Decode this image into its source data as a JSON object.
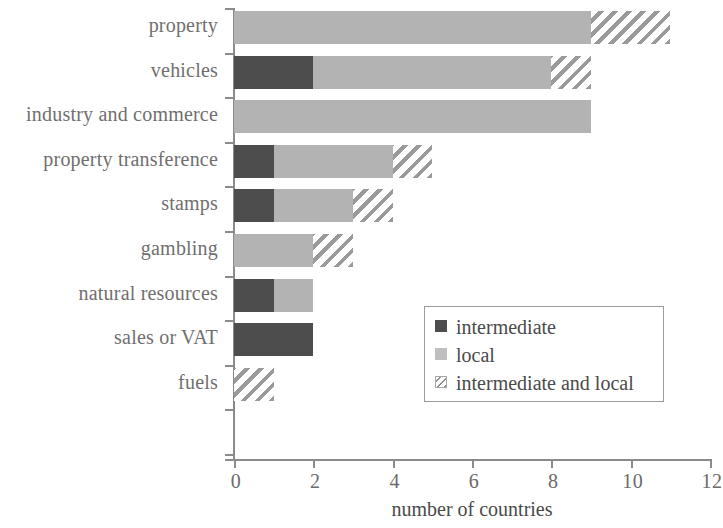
{
  "chart_data": {
    "type": "bar",
    "orientation": "horizontal",
    "stacked": true,
    "title": "",
    "xlabel": "number of countries",
    "ylabel": "",
    "xlim": [
      0,
      12
    ],
    "xticks": [
      0,
      2,
      4,
      6,
      8,
      10,
      12
    ],
    "xtick_labels": [
      "0",
      "2",
      "4",
      "6",
      "8",
      "10",
      "12"
    ],
    "grid": false,
    "legend_position": "inside-right",
    "categories": [
      "property",
      "vehicles",
      "industry and commerce",
      "property transference",
      "stamps",
      "gambling",
      "natural resources",
      "sales or VAT",
      "fuels"
    ],
    "series": [
      {
        "name": "intermediate",
        "color": "#4d4d4d",
        "values": [
          0,
          2,
          0,
          1,
          1,
          0,
          1,
          2,
          0
        ]
      },
      {
        "name": "local",
        "color": "#b3b3b3",
        "values": [
          9,
          6,
          9,
          3,
          2,
          2,
          1,
          0,
          0
        ]
      },
      {
        "name": "intermediate and local",
        "color": "#9a9a9a",
        "pattern": "diagonal-hatch",
        "values": [
          2,
          1,
          0,
          1,
          1,
          1,
          0,
          0,
          1
        ]
      }
    ],
    "totals": [
      11,
      9,
      9,
      5,
      4,
      3,
      2,
      2,
      1
    ]
  },
  "legend": {
    "items": [
      {
        "label": "intermediate",
        "swatch": "solid-dark-swatch"
      },
      {
        "label": "local",
        "swatch": "solid-light-swatch"
      },
      {
        "label": "intermediate and local",
        "swatch": "hatched-swatch"
      }
    ]
  },
  "axis": {
    "x_title": "number of countries"
  }
}
